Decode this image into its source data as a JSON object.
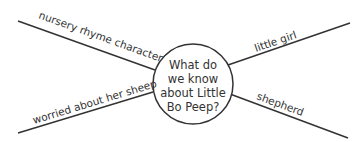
{
  "diagram": {
    "type": "concept-web",
    "colors": {
      "line": "#333333",
      "text": "#333333",
      "background": "#ffffff"
    },
    "center": {
      "lines": [
        "What do",
        "we know",
        "about Little",
        "Bo Peep?"
      ]
    },
    "spokes": [
      {
        "position": "top-left",
        "label": "nursery rhyme character"
      },
      {
        "position": "top-right",
        "label": "little girl"
      },
      {
        "position": "bottom-left",
        "label": "worried about her sheep"
      },
      {
        "position": "bottom-right",
        "label": "shepherd"
      }
    ]
  }
}
